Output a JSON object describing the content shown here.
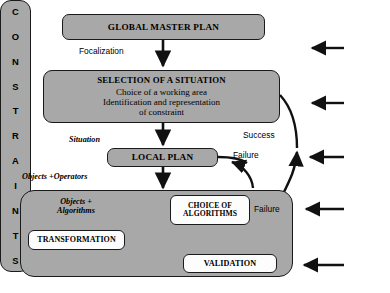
{
  "diagram": {
    "colors": {
      "node_fill_gray": "#a8a8a8",
      "node_fill_white": "#fdfdfd",
      "stroke": "#1a1a1a",
      "background": "#ffffff"
    },
    "nodes": {
      "global_master_plan": {
        "label": "GLOBAL MASTER PLAN"
      },
      "selection_of_a_situation": {
        "title": "SELECTION OF A  SITUATION",
        "line1": "Choice of a working area",
        "line2": "Identification and representation",
        "line3": "of constraint"
      },
      "local_plan": {
        "label": "LOCAL PLAN"
      },
      "choice_of_algorithms": {
        "line1": "CHOICE OF",
        "line2": "ALGORITHMS"
      },
      "transformation": {
        "label": "TRANSFORMATION"
      },
      "validation": {
        "label": "VALIDATION"
      },
      "constraints": {
        "label": "CONSTRAINTS",
        "letters": [
          "C",
          "O",
          "N",
          "S",
          "T",
          "R",
          "A",
          "I",
          "N",
          "T",
          "S"
        ]
      }
    },
    "edge_labels": {
      "focalization": "Focalization",
      "situation": "Situation",
      "objects_operators": "Objects +Operators",
      "objects_algorithms_line1": "Objects +",
      "objects_algorithms_line2": "Algorithms",
      "success": "Success",
      "failure_local_plan": "Failure",
      "failure_validation": "Failure"
    }
  }
}
